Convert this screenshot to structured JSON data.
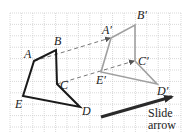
{
  "diagram": {
    "type": "translation",
    "colors": {
      "grid": "#c8c8c8",
      "original": "#1a1a1a",
      "image": "#a0a0a0",
      "dashed": "#777777",
      "arrow": "#2a2a2a"
    },
    "grid": {
      "x0": 10,
      "y0": 13,
      "x1": 181,
      "y1": 132,
      "step": 11.4
    },
    "original": {
      "vertices": [
        {
          "name": "A",
          "x": 34,
          "y": 61,
          "lx": 24,
          "ly": 58
        },
        {
          "name": "B",
          "x": 56,
          "y": 50,
          "lx": 54,
          "ly": 45
        },
        {
          "name": "C",
          "x": 57,
          "y": 84,
          "lx": 60,
          "ly": 89
        },
        {
          "name": "D",
          "x": 80,
          "y": 107,
          "lx": 82,
          "ly": 115
        },
        {
          "name": "E",
          "x": 23,
          "y": 96,
          "lx": 15,
          "ly": 108
        }
      ]
    },
    "image": {
      "vertices": [
        {
          "name": "A′",
          "x": 111,
          "y": 38,
          "lx": 102,
          "ly": 34
        },
        {
          "name": "B′",
          "x": 135,
          "y": 25,
          "lx": 137,
          "ly": 19
        },
        {
          "name": "C′",
          "x": 135,
          "y": 61,
          "lx": 138,
          "ly": 65
        },
        {
          "name": "D′",
          "x": 157,
          "y": 84,
          "lx": 157,
          "ly": 95
        },
        {
          "name": "E′",
          "x": 101,
          "y": 72,
          "lx": 96,
          "ly": 84
        }
      ]
    },
    "guides": [
      {
        "from": "A",
        "to": "A′",
        "x1": 34,
        "y1": 61,
        "x2": 110,
        "y2": 38
      },
      {
        "from": "C",
        "to": "C′",
        "x1": 57,
        "y1": 84,
        "x2": 134,
        "y2": 61
      }
    ],
    "slide_arrow": {
      "x1": 101,
      "y1": 117,
      "x2": 178,
      "y2": 95,
      "label_line1": "Slide",
      "label_line2": "arrow",
      "label_x": 148,
      "label_y1": 117,
      "label_y2": 129
    }
  }
}
